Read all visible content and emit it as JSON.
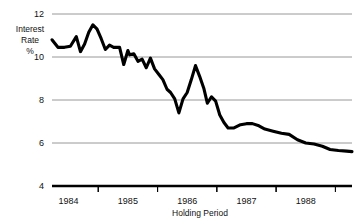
{
  "chart_data": {
    "type": "line",
    "title": "",
    "xlabel": "Holding Period",
    "ylabel": "Interest Rate %",
    "ylabel_lines": [
      "Interest",
      "Rate",
      "%"
    ],
    "ylim": [
      4,
      12
    ],
    "yticks": [
      4,
      6,
      8,
      10,
      12
    ],
    "ytick_labels": [
      "4",
      "6",
      "8",
      "10",
      "12"
    ],
    "xlim": [
      1983.72,
      1988.78
    ],
    "xticks": [
      1984,
      1985,
      1986,
      1987,
      1988
    ],
    "xtick_labels": [
      "1984",
      "1985",
      "1986",
      "1987",
      "1988"
    ],
    "grid": true,
    "grid_axis": "y",
    "legend": null,
    "series": [
      {
        "name": "Interest Rate",
        "color": "#000000",
        "x": [
          1983.72,
          1983.82,
          1983.93,
          1984.03,
          1984.13,
          1984.2,
          1984.27,
          1984.34,
          1984.41,
          1984.48,
          1984.55,
          1984.62,
          1984.69,
          1984.76,
          1984.86,
          1984.93,
          1985.0,
          1985.03,
          1985.1,
          1985.17,
          1985.24,
          1985.31,
          1985.38,
          1985.45,
          1985.52,
          1985.59,
          1985.66,
          1985.72,
          1985.79,
          1985.86,
          1985.93,
          1986.0,
          1986.07,
          1986.14,
          1986.21,
          1986.28,
          1986.34,
          1986.41,
          1986.48,
          1986.55,
          1986.62,
          1986.69,
          1986.79,
          1986.9,
          1987.0,
          1987.1,
          1987.21,
          1987.31,
          1987.45,
          1987.59,
          1987.72,
          1987.86,
          1988.0,
          1988.14,
          1988.28,
          1988.41,
          1988.55,
          1988.69,
          1988.78
        ],
        "y": [
          10.8,
          10.45,
          10.45,
          10.5,
          10.95,
          10.25,
          10.6,
          11.15,
          11.5,
          11.3,
          10.85,
          10.35,
          10.55,
          10.45,
          10.45,
          9.65,
          10.3,
          10.1,
          10.15,
          9.8,
          9.9,
          9.5,
          9.95,
          9.45,
          9.2,
          8.95,
          8.5,
          8.35,
          8.05,
          7.4,
          8.05,
          8.35,
          8.95,
          9.6,
          9.1,
          8.55,
          7.85,
          8.15,
          7.95,
          7.3,
          6.95,
          6.7,
          6.7,
          6.85,
          6.9,
          6.9,
          6.8,
          6.65,
          6.55,
          6.45,
          6.4,
          6.15,
          6.0,
          5.95,
          5.85,
          5.7,
          5.65,
          5.62,
          5.6
        ]
      }
    ]
  },
  "style": {
    "line_color": "#000000",
    "grid_color": "#8c8c8c",
    "baseline_color": "#000000",
    "text_color": "#111111",
    "background": "#ffffff"
  }
}
